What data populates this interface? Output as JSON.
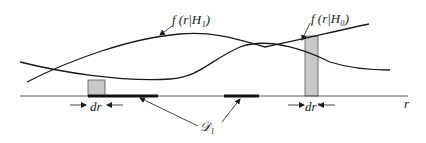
{
  "diagram": {
    "labels": {
      "f_h1": "f (r|H₁)",
      "f_h0": "f (r|H₀)",
      "dr_left": "dr",
      "dr_right": "dr′",
      "decision_region": "𝒟₁",
      "axis": "r"
    },
    "colors": {
      "curve": "#1a1a1a",
      "axis": "#555555",
      "shaded_strip": "#c8c8c8",
      "decision_segment": "#111111",
      "background": "#ffffff"
    },
    "elements": {
      "curves": [
        "f(r|H1) likelihood curve",
        "f(r|H0) likelihood curve"
      ],
      "shaded_strips": [
        "left strip of width dr",
        "right strip of width dr'"
      ],
      "decision_segments": 2
    }
  }
}
